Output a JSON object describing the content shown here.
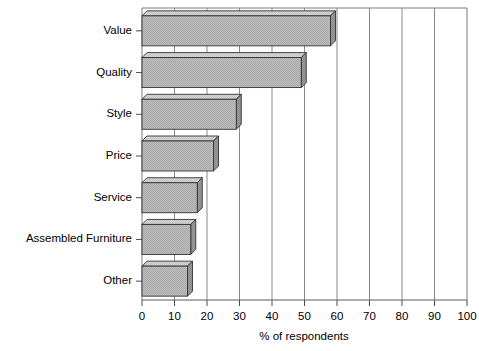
{
  "chart_data": {
    "type": "bar",
    "orientation": "horizontal",
    "style": "3d-extruded",
    "title": "",
    "subtitle": "",
    "xlabel": "% of respondents",
    "ylabel": "",
    "categories": [
      "Value",
      "Quality",
      "Style",
      "Price",
      "Service",
      "Assembled Furniture",
      "Other"
    ],
    "values": [
      58,
      49,
      29,
      22,
      17,
      15,
      14
    ],
    "series": [
      {
        "name": "% of respondents",
        "values": [
          58,
          49,
          29,
          22,
          17,
          15,
          14
        ]
      }
    ],
    "xlim": [
      0,
      100
    ],
    "xticks": [
      0,
      10,
      20,
      30,
      40,
      50,
      60,
      70,
      80,
      90,
      100
    ],
    "xtick_labels": [
      "0",
      "10",
      "20",
      "30",
      "40",
      "50",
      "60",
      "70",
      "80",
      "90",
      "100"
    ],
    "grid": "vertical",
    "legend": "none",
    "annotations": [],
    "colors": {
      "bar_front": "#b8b8b8",
      "bar_top": "#d0d0d0",
      "bar_side": "#909090",
      "bar_outline": "#333333",
      "axis": "#555555",
      "grid": "#888888",
      "background": "#ffffff",
      "text": "#000000"
    }
  },
  "chart": {
    "axis_title": "% of respondents",
    "ticks": [
      {
        "label": "0",
        "value": 0
      },
      {
        "label": "10",
        "value": 10
      },
      {
        "label": "20",
        "value": 20
      },
      {
        "label": "30",
        "value": 30
      },
      {
        "label": "40",
        "value": 40
      },
      {
        "label": "50",
        "value": 50
      },
      {
        "label": "60",
        "value": 60
      },
      {
        "label": "70",
        "value": 70
      },
      {
        "label": "80",
        "value": 80
      },
      {
        "label": "90",
        "value": 90
      },
      {
        "label": "100",
        "value": 100
      }
    ],
    "bars": [
      {
        "label": "Value",
        "value": 58
      },
      {
        "label": "Quality",
        "value": 49
      },
      {
        "label": "Style",
        "value": 29
      },
      {
        "label": "Price",
        "value": 22
      },
      {
        "label": "Service",
        "value": 17
      },
      {
        "label": "Assembled Furniture",
        "value": 15
      },
      {
        "label": "Other",
        "value": 14
      }
    ]
  }
}
